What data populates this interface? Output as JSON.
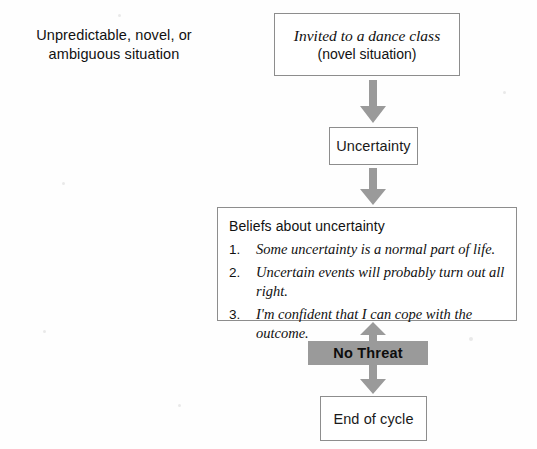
{
  "diagram": {
    "title_caption": {
      "lines": [
        "Unpredictable, novel, or",
        "ambiguous situation"
      ]
    },
    "nodes": {
      "situation": {
        "line1": "Invited to a dance class",
        "line2": "(novel situation)"
      },
      "uncertainty": {
        "label": "Uncertainty"
      },
      "beliefs": {
        "title": "Beliefs about uncertainty",
        "items": [
          {
            "number": "1.",
            "text": "Some uncertainty is a normal part of life."
          },
          {
            "number": "2.",
            "text": "Uncertain events will probably turn out all right."
          },
          {
            "number": "3.",
            "text": "I'm confident that I can cope with the outcome."
          }
        ]
      },
      "no_threat": {
        "label": "No Threat"
      },
      "end_of_cycle": {
        "label": "End of cycle"
      }
    },
    "arrows": [
      {
        "name": "arrow-situation-to-uncertainty",
        "direction": "down"
      },
      {
        "name": "arrow-uncertainty-to-beliefs",
        "direction": "down"
      },
      {
        "name": "arrow-nothreat-to-beliefs",
        "direction": "up"
      },
      {
        "name": "arrow-nothreat-to-endofcycle",
        "direction": "down"
      }
    ],
    "colors": {
      "background": "#fefefe",
      "box_border": "#8d8d8d",
      "box_fill": "#ffffff",
      "highlight_fill": "#9a9a9a",
      "arrow_fill": "#9a9a9a",
      "text": "#111111"
    }
  }
}
